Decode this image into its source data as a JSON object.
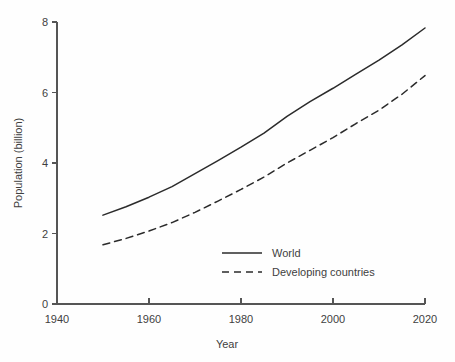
{
  "chart_data": {
    "type": "line",
    "title": "",
    "xlabel": "Year",
    "ylabel": "Population (billion)",
    "xlim": [
      1940,
      2020
    ],
    "ylim": [
      0,
      8
    ],
    "xticks": [
      1940,
      1960,
      1980,
      2000,
      2020
    ],
    "xtick_labels": [
      "1940",
      "1960",
      "1980",
      "2000",
      "2020"
    ],
    "yticks": [
      0,
      2,
      4,
      6,
      8
    ],
    "ytick_labels": [
      "0",
      "2",
      "4",
      "6",
      "8"
    ],
    "grid": false,
    "legend_position": "center",
    "x": [
      1950,
      1955,
      1960,
      1965,
      1970,
      1975,
      1980,
      1985,
      1990,
      1995,
      2000,
      2005,
      2010,
      2015,
      2020
    ],
    "series": [
      {
        "name": "World",
        "style": "solid",
        "color": "#2b2b2b",
        "values": [
          2.52,
          2.76,
          3.03,
          3.33,
          3.7,
          4.07,
          4.45,
          4.85,
          5.32,
          5.74,
          6.12,
          6.52,
          6.92,
          7.35,
          7.83
        ]
      },
      {
        "name": "Developing countries",
        "style": "dashed",
        "color": "#2b2b2b",
        "values": [
          1.68,
          1.86,
          2.07,
          2.31,
          2.6,
          2.92,
          3.25,
          3.6,
          4.0,
          4.36,
          4.72,
          5.12,
          5.5,
          5.95,
          6.48
        ]
      }
    ]
  },
  "legend": {
    "entries": [
      {
        "label": "World"
      },
      {
        "label": "Developing countries"
      }
    ]
  }
}
